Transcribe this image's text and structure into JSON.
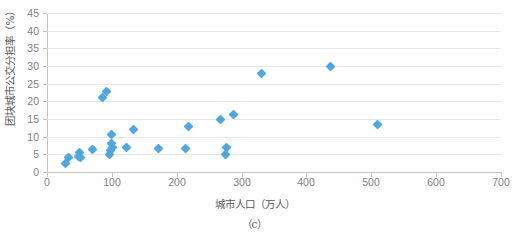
{
  "chart_data": {
    "type": "scatter",
    "title": "",
    "subtitle": "",
    "caption": "（c）",
    "xlabel": "城市人口（万人）",
    "ylabel": "团块城市公交分担率（%）",
    "xlim": [
      0,
      700
    ],
    "ylim": [
      0,
      45
    ],
    "xticks": [
      0,
      100,
      200,
      300,
      400,
      500,
      600,
      700
    ],
    "yticks": [
      0,
      5,
      10,
      15,
      20,
      25,
      30,
      35,
      40,
      45
    ],
    "xtick_labels": [
      "0",
      "100",
      "200",
      "300",
      "400",
      "500",
      "600",
      "700"
    ],
    "ytick_labels": [
      "0",
      "5",
      "10",
      "15",
      "20",
      "25",
      "30",
      "35",
      "40",
      "45"
    ],
    "grid": "horizontal",
    "legend": "none",
    "marker": "diamond",
    "marker_color": "#4ea7dd",
    "series": [
      {
        "name": "团块城市",
        "points": [
          {
            "x": 28,
            "y": 2.5
          },
          {
            "x": 33,
            "y": 4.0
          },
          {
            "x": 48,
            "y": 4.5
          },
          {
            "x": 50,
            "y": 5.5
          },
          {
            "x": 52,
            "y": 4.0
          },
          {
            "x": 70,
            "y": 6.5
          },
          {
            "x": 85,
            "y": 21.0
          },
          {
            "x": 92,
            "y": 22.8
          },
          {
            "x": 97,
            "y": 5.0
          },
          {
            "x": 98,
            "y": 6.0
          },
          {
            "x": 99,
            "y": 8.0
          },
          {
            "x": 100,
            "y": 10.5
          },
          {
            "x": 101,
            "y": 7.0
          },
          {
            "x": 122,
            "y": 7.0
          },
          {
            "x": 133,
            "y": 12.0
          },
          {
            "x": 172,
            "y": 6.8
          },
          {
            "x": 213,
            "y": 6.8
          },
          {
            "x": 218,
            "y": 12.8
          },
          {
            "x": 268,
            "y": 14.8
          },
          {
            "x": 275,
            "y": 5.0
          },
          {
            "x": 277,
            "y": 7.0
          },
          {
            "x": 288,
            "y": 16.2
          },
          {
            "x": 330,
            "y": 27.8
          },
          {
            "x": 437,
            "y": 29.8
          },
          {
            "x": 510,
            "y": 13.5
          }
        ]
      }
    ]
  },
  "axes": {
    "y_axis_title": "团块城市公交分担率（%）",
    "x_axis_title": "城市人口（万人）"
  },
  "figure": {
    "caption": "（c）"
  },
  "colors": {
    "marker": "#4ea7dd",
    "gridline": "#e8e8e8",
    "axis": "#c8c4bd",
    "tick_text": "#7f7f7f",
    "title_text": "#595959",
    "background": "#ffffff"
  }
}
